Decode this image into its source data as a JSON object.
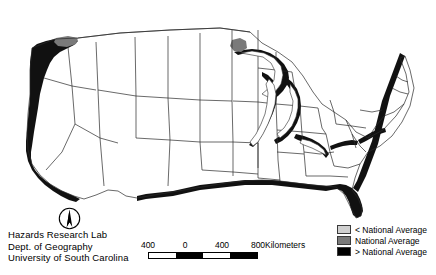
{
  "figure": {
    "type": "choropleth-map",
    "region": "Contiguous United States",
    "background_color": "#ffffff"
  },
  "credits": {
    "lines": [
      "Hazards Research Lab",
      "Dept. of Geography",
      "University of South Carolina"
    ]
  },
  "north_arrow": {
    "icon": "north-arrow-icon",
    "direction": "up"
  },
  "scale_bar": {
    "tick_labels": [
      "400",
      "0",
      "400",
      "800"
    ],
    "units_label": "Kilometers",
    "segment_fills": [
      "#ffffff",
      "#000000",
      "#ffffff",
      "#000000"
    ]
  },
  "legend": {
    "items": [
      {
        "label": "< National Average",
        "color": "#d0d0d0"
      },
      {
        "label": "National Average",
        "color": "#7a7a7a"
      },
      {
        "label": "> National Average",
        "color": "#000000"
      }
    ]
  },
  "map_colors": {
    "below_average": "#d0d0d0",
    "average": "#7a7a7a",
    "above_average": "#111111",
    "boundary_stroke": "#3c3c3c",
    "state_stroke": "#2a2a2a",
    "fill_default": "#ffffff"
  }
}
